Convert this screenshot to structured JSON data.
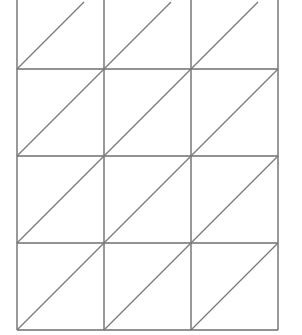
{
  "diagram": {
    "type": "lattice-multiplication-grid",
    "columns": 3,
    "rows": 4,
    "top_row_cropped": true,
    "cell_width": 87,
    "cell_height": 87,
    "origin_x": 17,
    "bottom_y": 330,
    "diagonal_direction": "bottom-left-to-top-right",
    "line_color": "#6e6e6e",
    "background_color": "#ffffff"
  }
}
